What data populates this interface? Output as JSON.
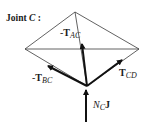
{
  "title": {
    "prefix": "Joint ",
    "joint": "C",
    "suffix": " :"
  },
  "vectors": [
    {
      "id": "neg-T-AC",
      "sign": "-",
      "symbol": "T",
      "subscript": "AC"
    },
    {
      "id": "neg-T-BC",
      "sign": "-",
      "symbol": "T",
      "subscript": "BC"
    },
    {
      "id": "T-CD",
      "sign": "",
      "symbol": "T",
      "subscript": "CD"
    },
    {
      "id": "N-C-J",
      "symbol": "N",
      "subscript": "C",
      "unit": "J"
    }
  ],
  "colors": {
    "line": "#3a3a3a",
    "arrow": "#111111",
    "background": "#ffffff"
  }
}
